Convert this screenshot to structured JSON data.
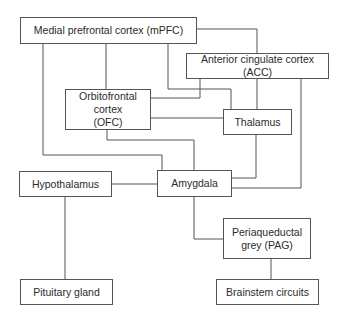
{
  "diagram": {
    "type": "block-diagram",
    "line_color": "#555555",
    "nodes": {
      "mpfc": {
        "label": "Medial prefrontal cortex (mPFC)"
      },
      "acc": {
        "label": "Anterior cingulate cortex (ACC)"
      },
      "ofc": {
        "label": "Orbitofrontal cortex (OFC)"
      },
      "thalamus": {
        "label": "Thalamus"
      },
      "hypothalamus": {
        "label": "Hypothalamus"
      },
      "amygdala": {
        "label": "Amygdala"
      },
      "pag": {
        "label": "Periaqueductal grey (PAG)"
      },
      "pituitary": {
        "label": "Pituitary gland"
      },
      "brainstem": {
        "label": "Brainstem circuits"
      }
    },
    "edges": [
      [
        "mpfc",
        "acc"
      ],
      [
        "mpfc",
        "ofc"
      ],
      [
        "mpfc",
        "thalamus"
      ],
      [
        "mpfc",
        "amygdala"
      ],
      [
        "acc",
        "ofc"
      ],
      [
        "acc",
        "thalamus"
      ],
      [
        "acc",
        "amygdala"
      ],
      [
        "ofc",
        "thalamus"
      ],
      [
        "ofc",
        "amygdala"
      ],
      [
        "thalamus",
        "amygdala"
      ],
      [
        "hypothalamus",
        "amygdala"
      ],
      [
        "hypothalamus",
        "pituitary"
      ],
      [
        "amygdala",
        "pag"
      ],
      [
        "pag",
        "brainstem"
      ]
    ]
  }
}
